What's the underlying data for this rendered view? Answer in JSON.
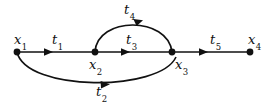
{
  "diagram": {
    "colors": {
      "stroke": "#111111",
      "background": "#ffffff"
    },
    "nodes": [
      {
        "id": "x1",
        "base": "x",
        "sub": "1",
        "label": "x1",
        "cx": 17,
        "cy": 52,
        "label_x": 14,
        "label_y": 33
      },
      {
        "id": "x2",
        "base": "x",
        "sub": "2",
        "label": "x2",
        "cx": 95,
        "cy": 52,
        "label_x": 89,
        "label_y": 58
      },
      {
        "id": "x3",
        "base": "x",
        "sub": "3",
        "label": "x3",
        "cx": 172,
        "cy": 52,
        "label_x": 175,
        "label_y": 58
      },
      {
        "id": "x4",
        "base": "x",
        "sub": "4",
        "label": "x4",
        "cx": 250,
        "cy": 52,
        "label_x": 248,
        "label_y": 33
      }
    ],
    "edges": [
      {
        "id": "t1",
        "base": "t",
        "sub": "1",
        "label": "t1",
        "from": "x1",
        "to": "x2",
        "shape": "straight",
        "label_x": 52,
        "label_y": 33
      },
      {
        "id": "t2",
        "base": "t",
        "sub": "2",
        "label": "t2",
        "from": "x1",
        "to": "x3",
        "shape": "arc-below",
        "label_x": 96,
        "label_y": 85
      },
      {
        "id": "t3",
        "base": "t",
        "sub": "3",
        "label": "t3",
        "from": "x2",
        "to": "x3",
        "shape": "straight",
        "label_x": 126,
        "label_y": 33
      },
      {
        "id": "t4",
        "base": "t",
        "sub": "4",
        "label": "t4",
        "from": "x2",
        "to": "x3",
        "shape": "arc-above",
        "label_x": 124,
        "label_y": 3
      },
      {
        "id": "t5",
        "base": "t",
        "sub": "5",
        "label": "t5",
        "from": "x3",
        "to": "x4",
        "shape": "straight",
        "label_x": 210,
        "label_y": 33
      }
    ]
  }
}
